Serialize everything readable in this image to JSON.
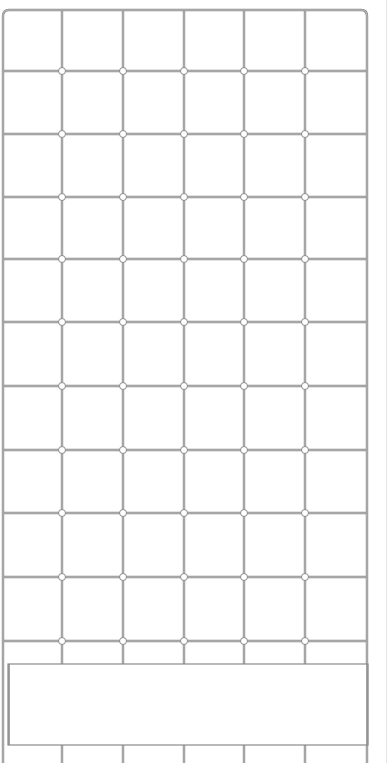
{
  "image": {
    "subject": "wire gridwall panel with blank header sign",
    "width": 390,
    "height": 763
  },
  "colors": {
    "background": "#ffffff",
    "wire": "#8a8a8a",
    "wire_light": "#cfcfcf",
    "node_fill": "#ffffff",
    "sign_fill": "#ffffff",
    "edge_strip": "#e6e6e6"
  },
  "grid": {
    "frame": {
      "left": 3,
      "top": 10,
      "right": 367,
      "bottom": 763
    },
    "vertical_x": [
      62,
      123,
      184,
      244,
      305
    ],
    "horizontal_y": [
      71,
      134,
      197,
      259,
      322,
      386,
      450,
      513,
      577,
      641
    ],
    "node_radius": 3.5
  },
  "sign": {
    "left": 8,
    "top": 664,
    "right": 368,
    "bottom": 745,
    "text": ""
  }
}
